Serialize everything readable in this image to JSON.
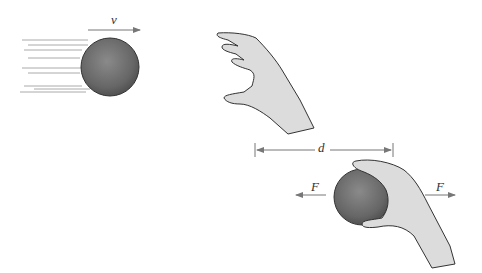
{
  "diagram": {
    "labels": {
      "velocity": "v",
      "distance": "d",
      "force_left": "F",
      "force_right": "F"
    },
    "colors": {
      "ball": "#707070",
      "hand_fill": "#d9d9d9",
      "outline": "#333333",
      "arrow": "#777777"
    }
  }
}
